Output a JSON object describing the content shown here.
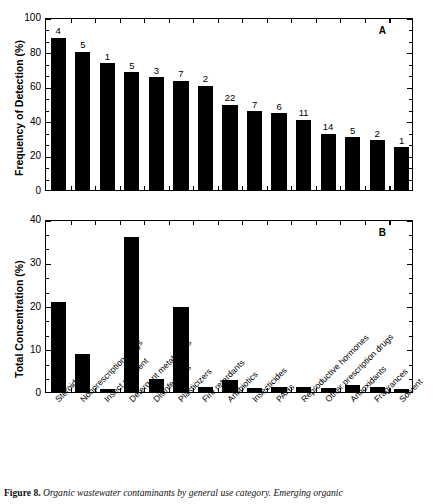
{
  "figure": {
    "caption_number": "Figure 8.",
    "caption_text": "Organic wastewater contaminants by general use category. Emerging organic"
  },
  "panel_a": {
    "letter": "A",
    "ylabel": "Frequency of Detection (%)",
    "yticks": [
      "0",
      "20",
      "40",
      "60",
      "80",
      "100"
    ]
  },
  "panel_b": {
    "letter": "B",
    "ylabel": "Total Concentration (%)",
    "yticks": [
      "0",
      "10",
      "20",
      "30",
      "40"
    ]
  },
  "categories": [
    "Steroids",
    "Nonprescription drugs",
    "Insect repellent",
    "Detergent metabolites",
    "Disinfectants",
    "Plasticizers",
    "Fire retardants",
    "Antibiotics",
    "Insecticides",
    "PAHs",
    "Reproductive hormones",
    "Other prescription drugs",
    "Antioxidants",
    "Fragrances",
    "Solvent"
  ],
  "chart_data": [
    {
      "type": "bar",
      "title": "A",
      "xlabel": "",
      "ylabel": "Frequency of Detection (%)",
      "ylim": [
        0,
        100
      ],
      "ytick_values": [
        0,
        20,
        40,
        60,
        80,
        100
      ],
      "grid": false,
      "legend": "none",
      "categories": [
        "Steroids",
        "Nonprescription drugs",
        "Insect repellent",
        "Detergent metabolites",
        "Disinfectants",
        "Plasticizers",
        "Fire retardants",
        "Antibiotics",
        "Insecticides",
        "PAHs",
        "Reproductive hormones",
        "Other prescription drugs",
        "Antioxidants",
        "Fragrances",
        "Solvent"
      ],
      "values": [
        89,
        81,
        74,
        69,
        66,
        64,
        61,
        50,
        46,
        45,
        41,
        33,
        31,
        29,
        25
      ],
      "annotations": [
        "4",
        "5",
        "1",
        "5",
        "3",
        "7",
        "2",
        "22",
        "7",
        "6",
        "11",
        "14",
        "5",
        "2",
        "1"
      ],
      "annotation_meaning": "number of compounds measured in each category"
    },
    {
      "type": "bar",
      "title": "B",
      "xlabel": "",
      "ylabel": "Total Concentration (%)",
      "ylim": [
        0,
        40
      ],
      "ytick_values": [
        0,
        10,
        20,
        30,
        40
      ],
      "grid": false,
      "legend": "none",
      "categories": [
        "Steroids",
        "Nonprescription drugs",
        "Insect repellent",
        "Detergent metabolites",
        "Disinfectants",
        "Plasticizers",
        "Fire retardants",
        "Antibiotics",
        "Insecticides",
        "PAHs",
        "Reproductive hormones",
        "Other prescription drugs",
        "Antioxidants",
        "Fragrances",
        "Solvent"
      ],
      "values": [
        21,
        9,
        0.8,
        36.2,
        3,
        20,
        1.2,
        2.8,
        1,
        1.1,
        1.1,
        0.9,
        1.6,
        1.2,
        0.7
      ]
    }
  ]
}
